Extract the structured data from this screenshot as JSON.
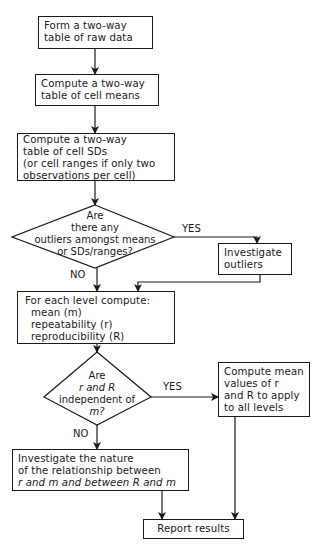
{
  "flowchart": {
    "nodes": {
      "raw_data": {
        "type": "process",
        "lines": [
          "Form a two-way",
          "table of raw data"
        ]
      },
      "cell_means": {
        "type": "process",
        "lines": [
          "Compute a two-way",
          "table of cell means"
        ]
      },
      "cell_sds": {
        "type": "process",
        "lines": [
          "Compute a two-way",
          "table of cell SDs",
          "(or cell ranges if only two",
          "observations per cell)"
        ]
      },
      "outliers_decision": {
        "type": "decision",
        "lines": [
          "Are",
          "there any",
          "outliers amongst means",
          "or SDs/ranges?"
        ]
      },
      "investigate_outliers": {
        "type": "process",
        "lines": [
          "Investigate",
          "outliers"
        ]
      },
      "compute_levels": {
        "type": "process",
        "lines": [
          "For each level compute:",
          "mean (m)",
          "repeatability (r)",
          "reproducibility (R)"
        ]
      },
      "independence_decision": {
        "type": "decision",
        "lines": [
          "Are",
          "r and R",
          "independent of",
          "m?"
        ]
      },
      "compute_mean_values": {
        "type": "process",
        "lines": [
          "Compute mean",
          "values of r",
          "and R to apply",
          "to all levels"
        ]
      },
      "investigate_relationship": {
        "type": "process",
        "lines": [
          "Investigate the nature",
          "of the relationship between",
          "r and m and between R and m"
        ]
      },
      "report": {
        "type": "terminal",
        "lines": [
          "Report results"
        ]
      }
    },
    "edge_labels": {
      "outliers_yes": "YES",
      "outliers_no": "NO",
      "independence_yes": "YES",
      "independence_no": "NO"
    },
    "edges": [
      {
        "from": "raw_data",
        "to": "cell_means"
      },
      {
        "from": "cell_means",
        "to": "cell_sds"
      },
      {
        "from": "cell_sds",
        "to": "outliers_decision"
      },
      {
        "from": "outliers_decision",
        "to": "investigate_outliers",
        "label": "YES"
      },
      {
        "from": "outliers_decision",
        "to": "compute_levels",
        "label": "NO"
      },
      {
        "from": "investigate_outliers",
        "to": "compute_levels"
      },
      {
        "from": "compute_levels",
        "to": "independence_decision"
      },
      {
        "from": "independence_decision",
        "to": "compute_mean_values",
        "label": "YES"
      },
      {
        "from": "independence_decision",
        "to": "investigate_relationship",
        "label": "NO"
      },
      {
        "from": "investigate_relationship",
        "to": "report"
      },
      {
        "from": "compute_mean_values",
        "to": "report"
      }
    ]
  }
}
